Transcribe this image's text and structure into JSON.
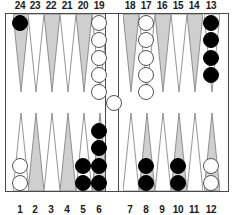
{
  "board": {
    "title": "Backgammon board position",
    "colors": {
      "dark_triangle": "#cfcfcf",
      "light_triangle": "#ffffff",
      "triangle_outline": "#7a7a7a",
      "frame": "#4a4a4a",
      "black_checker": "#000000",
      "white_checker": "#ffffff",
      "background": "#ffffff",
      "label_text": "#1a1a1a"
    },
    "top_labels": [
      "24",
      "23",
      "22",
      "21",
      "20",
      "19",
      "18",
      "17",
      "16",
      "15",
      "14",
      "13"
    ],
    "bottom_labels": [
      "1",
      "2",
      "3",
      "4",
      "5",
      "6",
      "7",
      "8",
      "9",
      "10",
      "11",
      "12"
    ],
    "points": [
      {
        "number": "24",
        "row": "top",
        "quadrant": "top-left",
        "shade": "dark",
        "checkers": 1,
        "color": "black"
      },
      {
        "number": "23",
        "row": "top",
        "quadrant": "top-left",
        "shade": "light",
        "checkers": 0,
        "color": ""
      },
      {
        "number": "22",
        "row": "top",
        "quadrant": "top-left",
        "shade": "dark",
        "checkers": 0,
        "color": ""
      },
      {
        "number": "21",
        "row": "top",
        "quadrant": "top-left",
        "shade": "light",
        "checkers": 0,
        "color": ""
      },
      {
        "number": "20",
        "row": "top",
        "quadrant": "top-left",
        "shade": "dark",
        "checkers": 0,
        "color": ""
      },
      {
        "number": "19",
        "row": "top",
        "quadrant": "top-left",
        "shade": "light",
        "checkers": 5,
        "color": "white"
      },
      {
        "number": "18",
        "row": "top",
        "quadrant": "top-right",
        "shade": "dark",
        "checkers": 0,
        "color": ""
      },
      {
        "number": "17",
        "row": "top",
        "quadrant": "top-right",
        "shade": "light",
        "checkers": 5,
        "color": "white"
      },
      {
        "number": "16",
        "row": "top",
        "quadrant": "top-right",
        "shade": "dark",
        "checkers": 0,
        "color": ""
      },
      {
        "number": "15",
        "row": "top",
        "quadrant": "top-right",
        "shade": "light",
        "checkers": 0,
        "color": ""
      },
      {
        "number": "14",
        "row": "top",
        "quadrant": "top-right",
        "shade": "dark",
        "checkers": 0,
        "color": ""
      },
      {
        "number": "13",
        "row": "top",
        "quadrant": "top-right",
        "shade": "light",
        "checkers": 4,
        "color": "black"
      },
      {
        "number": "1",
        "row": "bottom",
        "quadrant": "bottom-left",
        "shade": "light",
        "checkers": 2,
        "color": "white"
      },
      {
        "number": "2",
        "row": "bottom",
        "quadrant": "bottom-left",
        "shade": "dark",
        "checkers": 0,
        "color": ""
      },
      {
        "number": "3",
        "row": "bottom",
        "quadrant": "bottom-left",
        "shade": "light",
        "checkers": 0,
        "color": ""
      },
      {
        "number": "4",
        "row": "bottom",
        "quadrant": "bottom-left",
        "shade": "dark",
        "checkers": 0,
        "color": ""
      },
      {
        "number": "5",
        "row": "bottom",
        "quadrant": "bottom-left",
        "shade": "light",
        "checkers": 2,
        "color": "black"
      },
      {
        "number": "6",
        "row": "bottom",
        "quadrant": "bottom-left",
        "shade": "dark",
        "checkers": 4,
        "color": "black"
      },
      {
        "number": "7",
        "row": "bottom",
        "quadrant": "bottom-right",
        "shade": "light",
        "checkers": 0,
        "color": ""
      },
      {
        "number": "8",
        "row": "bottom",
        "quadrant": "bottom-right",
        "shade": "dark",
        "checkers": 2,
        "color": "black"
      },
      {
        "number": "9",
        "row": "bottom",
        "quadrant": "bottom-right",
        "shade": "light",
        "checkers": 0,
        "color": ""
      },
      {
        "number": "10",
        "row": "bottom",
        "quadrant": "bottom-right",
        "shade": "dark",
        "checkers": 2,
        "color": "black"
      },
      {
        "number": "11",
        "row": "bottom",
        "quadrant": "bottom-right",
        "shade": "light",
        "checkers": 0,
        "color": ""
      },
      {
        "number": "12",
        "row": "bottom",
        "quadrant": "bottom-right",
        "shade": "dark",
        "checkers": 2,
        "color": "white"
      }
    ],
    "bar": {
      "white_checkers": 1,
      "black_checkers": 0
    },
    "totals": {
      "white_on_board": 12,
      "white_on_bar": 1,
      "black_on_board": 15
    }
  }
}
